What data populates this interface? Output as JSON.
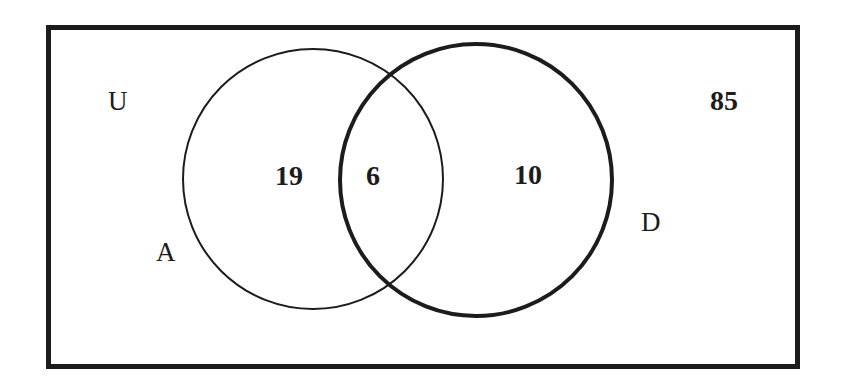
{
  "diagram": {
    "type": "venn-2-set",
    "title_visible": false,
    "background_color": "#ffffff",
    "stroke_color": "#1c1c1c",
    "universe": {
      "label": "U",
      "outside_count": "85",
      "border_width_px": 5,
      "rect": {
        "x": 46,
        "y": 25,
        "width": 754,
        "height": 344
      }
    },
    "sets": [
      {
        "id": "A",
        "label": "A",
        "label_position": "outside-left",
        "stroke_width_px": 2,
        "circle": {
          "cx": 313,
          "cy": 179,
          "r": 130
        },
        "only_count": "19"
      },
      {
        "id": "D",
        "label": "D",
        "label_position": "outside-right",
        "stroke_width_px": 4,
        "circle": {
          "cx": 476,
          "cy": 180,
          "r": 136
        },
        "only_count": "10"
      }
    ],
    "intersection": {
      "label": "A and D",
      "count": "6"
    }
  },
  "chart_data": {
    "type": "venn",
    "title": "",
    "regions": [
      {
        "name": "A only",
        "label": "19",
        "value": 19
      },
      {
        "name": "A and D",
        "label": "6",
        "value": 6
      },
      {
        "name": "D only",
        "label": "10",
        "value": 10
      },
      {
        "name": "Outside both sets",
        "label": "85",
        "value": 85
      }
    ],
    "set_labels": [
      "A",
      "D"
    ],
    "universe_label": "U",
    "legend": "none",
    "grid": false
  }
}
